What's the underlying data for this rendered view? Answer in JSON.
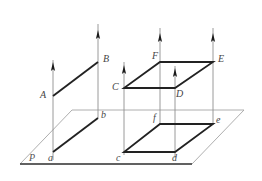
{
  "figure": {
    "colors": {
      "solid_stroke": "#262626",
      "plane_stroke": "#9a9a9a",
      "ray_stroke": "#8c8c8c",
      "arrowhead": "#1a1a1a",
      "label_color": "#3f3f3f",
      "background": "#ffffff"
    },
    "labels": {
      "A": "A",
      "B": "B",
      "C": "C",
      "D": "D",
      "E": "E",
      "F": "F",
      "a": "a",
      "b": "b",
      "c": "c",
      "d": "d",
      "e": "e",
      "f": "f",
      "P": "P"
    },
    "upper_objects": [
      {
        "name": "segment-AB",
        "vertices": [
          "A",
          "B"
        ]
      },
      {
        "name": "parallelogram-CDEF",
        "vertices": [
          "C",
          "D",
          "E",
          "F"
        ]
      }
    ],
    "lower_objects": [
      {
        "name": "segment-ab",
        "vertices": [
          "a",
          "b"
        ]
      },
      {
        "name": "parallelogram-cdef",
        "vertices": [
          "c",
          "d",
          "e",
          "f"
        ]
      }
    ],
    "plane": {
      "name": "P",
      "label": "P"
    },
    "projection_rays": [
      {
        "name": "ray-through-A-a",
        "x": 53,
        "top": 60,
        "bottom": 160,
        "arrow_y": 68
      },
      {
        "name": "ray-through-B-b",
        "x": 98,
        "top": 24,
        "bottom": 118,
        "arrow_y": 36
      },
      {
        "name": "ray-through-C-c",
        "x": 124,
        "top": 62,
        "bottom": 155,
        "arrow_y": 72
      },
      {
        "name": "ray-through-F-f",
        "x": 160,
        "top": 28,
        "bottom": 124,
        "arrow_y": 40
      },
      {
        "name": "ray-through-D-d",
        "x": 175,
        "top": 66,
        "bottom": 158,
        "arrow_y": 72
      },
      {
        "name": "ray-through-E-e",
        "x": 213,
        "top": 28,
        "bottom": 125,
        "arrow_y": 40
      }
    ]
  },
  "geometry": {
    "A": {
      "x": 53,
      "y": 96
    },
    "B": {
      "x": 98,
      "y": 62
    },
    "C": {
      "x": 124,
      "y": 88
    },
    "D": {
      "x": 175,
      "y": 88
    },
    "E": {
      "x": 213,
      "y": 62
    },
    "F": {
      "x": 160,
      "y": 62
    },
    "a": {
      "x": 53,
      "y": 152
    },
    "b": {
      "x": 98,
      "y": 118
    },
    "c": {
      "x": 124,
      "y": 152
    },
    "d": {
      "x": 175,
      "y": 152
    },
    "e": {
      "x": 213,
      "y": 124
    },
    "f": {
      "x": 160,
      "y": 124
    },
    "plane_corners": [
      {
        "x": 20,
        "y": 164
      },
      {
        "x": 72,
        "y": 110
      },
      {
        "x": 244,
        "y": 110
      },
      {
        "x": 192,
        "y": 164
      }
    ]
  }
}
